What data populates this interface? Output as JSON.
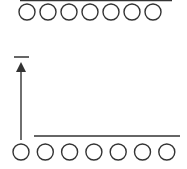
{
  "diagram": {
    "stroke_color": "#333333",
    "top_row": {
      "line": {
        "x1": 20,
        "x2": 172,
        "y": 0.5
      },
      "circles": {
        "count": 7,
        "cx_start": 27,
        "spacing": 21,
        "cy": 12,
        "r": 8
      }
    },
    "dash": {
      "x1": 14,
      "x2": 29,
      "y": 57
    },
    "arrow": {
      "x": 21,
      "y_top": 62,
      "y_bottom": 140,
      "direction": "up"
    },
    "bottom_row": {
      "line": {
        "x1": 34,
        "x2": 180,
        "y": 136
      },
      "circles": {
        "count": 7,
        "cx_start": 21,
        "spacing": 24.3,
        "cy": 152,
        "r": 8
      }
    }
  }
}
